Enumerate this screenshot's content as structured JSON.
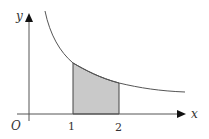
{
  "diagram": {
    "type": "function-area-diagram",
    "axes": {
      "x_label": "x",
      "y_label": "y",
      "origin_label": "O"
    },
    "ticks": [
      {
        "value": 1,
        "label": "1"
      },
      {
        "value": 2,
        "label": "2"
      }
    ],
    "shaded_region": {
      "from": 1,
      "to": 2,
      "fill": "#c9c9c9",
      "description": "area under curve between x = 1 and x = 2"
    },
    "curve": {
      "shape": "decreasing hyperbola-like curve",
      "color": "#555555"
    },
    "colors": {
      "axis": "#555555",
      "background": "#ffffff",
      "text": "#333333"
    }
  }
}
